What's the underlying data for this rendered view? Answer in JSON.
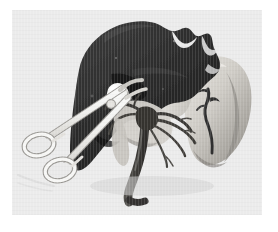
{
  "figure": {
    "kind": "anatomical-photograph",
    "modality": "grayscale photograph",
    "caption": "",
    "plate": {
      "background_color": "#e9e9e9",
      "page_color": "#ffffff",
      "left": 12,
      "top": 10,
      "width": 250,
      "height": 205
    }
  },
  "palette": {
    "page_white": "#ffffff",
    "plate_gray": "#e9e9e9",
    "liver_dark": "#2c2c2c",
    "liver_shadow": "#1b1b1b",
    "liver_highlight": "#474747",
    "organ_light": "#d8d6d1",
    "organ_mid": "#b7b4ae",
    "organ_shadow": "#8d8a85",
    "vessel_dark": "#3a3a3a",
    "vessel_mid": "#6f6d69",
    "instrument_white": "#f6f6f4",
    "instrument_edge": "#9a9894",
    "specular_white": "#fbfbfa"
  },
  "structures": [
    {
      "id": "liver",
      "label": "Liver",
      "tone": "dark",
      "position": "upper-left to center",
      "description": "Large dark hepatic mass occupying the upper two thirds of the frame with a notched superior-right border and a lobe tapering toward the lower left."
    },
    {
      "id": "adjacent-organ",
      "label": "Adjacent organ",
      "tone": "light",
      "position": "right",
      "description": "Pale ovoid organ on the right side of the specimen with a dark vascular groove running down its surface."
    },
    {
      "id": "hilar-vessels",
      "label": "Hilar vessels",
      "tone": "dark-branching",
      "position": "center",
      "description": "Branching vascular tree radiating from the hepatic hilum with multiple fine tributaries extending to the right and a thick trunk descending inferiorly."
    },
    {
      "id": "gallbladder-stump",
      "label": "Pale structure at instrument tip",
      "tone": "bright",
      "position": "center-left",
      "description": "Bright white rounded structure grasped between the jaws of the instrument."
    },
    {
      "id": "forceps",
      "label": "Surgical forceps",
      "tone": "white-metal",
      "position": "left",
      "description": "Ring-handled hemostatic forceps entering from the lower left, its jaws closing on the pale hilar structure."
    }
  ],
  "instrument": {
    "name": "surgical-forceps",
    "handles": 2,
    "handle_shape": "oval-ring",
    "orientation": "lower-left to upper-right"
  }
}
